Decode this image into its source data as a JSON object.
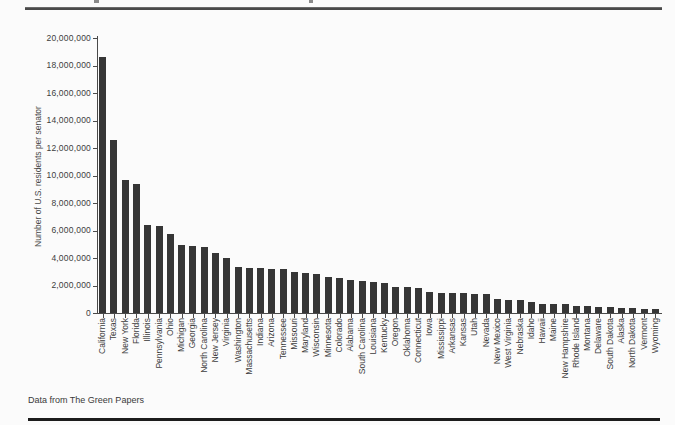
{
  "footer": {
    "source": "Data from The Green Papers"
  },
  "chart_data": {
    "type": "bar",
    "title": "",
    "xlabel": "",
    "ylabel": "Number of U.S. residents per senator",
    "ylim": [
      0,
      20000000
    ],
    "grid": false,
    "legend": "none",
    "bar_color": "#363636",
    "axis_color": "#4a4a4a",
    "y_tick_labels": [
      "0",
      "2,000,000",
      "4,000,000",
      "6,000,000",
      "8,000,000",
      "10,000,000",
      "12,000,000",
      "14,000,000",
      "16,000,000",
      "18,000,000",
      "20,000,000"
    ],
    "y_tick_values": [
      0,
      2000000,
      4000000,
      6000000,
      8000000,
      10000000,
      12000000,
      14000000,
      16000000,
      18000000,
      20000000
    ],
    "categories": [
      "California",
      "Texas",
      "New York",
      "Florida",
      "Illinois",
      "Pennsylvania",
      "Ohio",
      "Michigan",
      "Georgia",
      "North Carolina",
      "New Jersey",
      "Virginia",
      "Washington",
      "Massachusetts",
      "Indiana",
      "Arizona",
      "Tennessee",
      "Missouri",
      "Maryland",
      "Wisconsin",
      "Minnesota",
      "Colorado",
      "Alabama",
      "South Carolina",
      "Louisiana",
      "Kentucky",
      "Oregon",
      "Oklahoma",
      "Connecticut",
      "Iowa",
      "Mississippi",
      "Arkansas",
      "Kansas",
      "Utah",
      "Nevada",
      "New Mexico",
      "West Virginia",
      "Nebraska",
      "Idaho",
      "Hawaii",
      "Maine",
      "New Hampshire",
      "Rhode Island",
      "Montana",
      "Delaware",
      "South Dakota",
      "Alaska",
      "North Dakota",
      "Vermont",
      "Wyoming"
    ],
    "values": [
      18627000,
      12573000,
      9689000,
      9401000,
      6415000,
      6351000,
      5768000,
      4942000,
      4844000,
      4768000,
      4396000,
      4001000,
      3362000,
      3274000,
      3242000,
      3196000,
      3173000,
      2994000,
      2887000,
      2843000,
      2652000,
      2515000,
      2390000,
      2313000,
      2267000,
      2170000,
      1916000,
      1876000,
      1787000,
      1523000,
      1484000,
      1458000,
      1427000,
      1382000,
      1350000,
      1030000,
      926000,
      913000,
      784000,
      680000,
      664000,
      658000,
      526000,
      495000,
      449000,
      407000,
      355000,
      336000,
      313000,
      282000
    ]
  }
}
